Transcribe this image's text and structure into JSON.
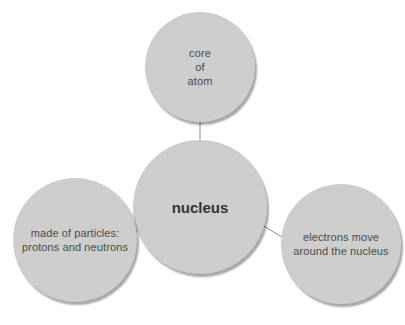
{
  "diagram": {
    "type": "concept-map",
    "center": {
      "label": "nucleus"
    },
    "nodes": [
      {
        "id": "top",
        "label": "core\nof\natom"
      },
      {
        "id": "left",
        "label": "made of particles:\nprotons and neutrons"
      },
      {
        "id": "right",
        "label": "electrons move\naround the nucleus"
      }
    ],
    "colors": {
      "node_fill": "#cdcdcd",
      "connector": "#8a8a8a",
      "text": "#4a4a4a"
    }
  }
}
